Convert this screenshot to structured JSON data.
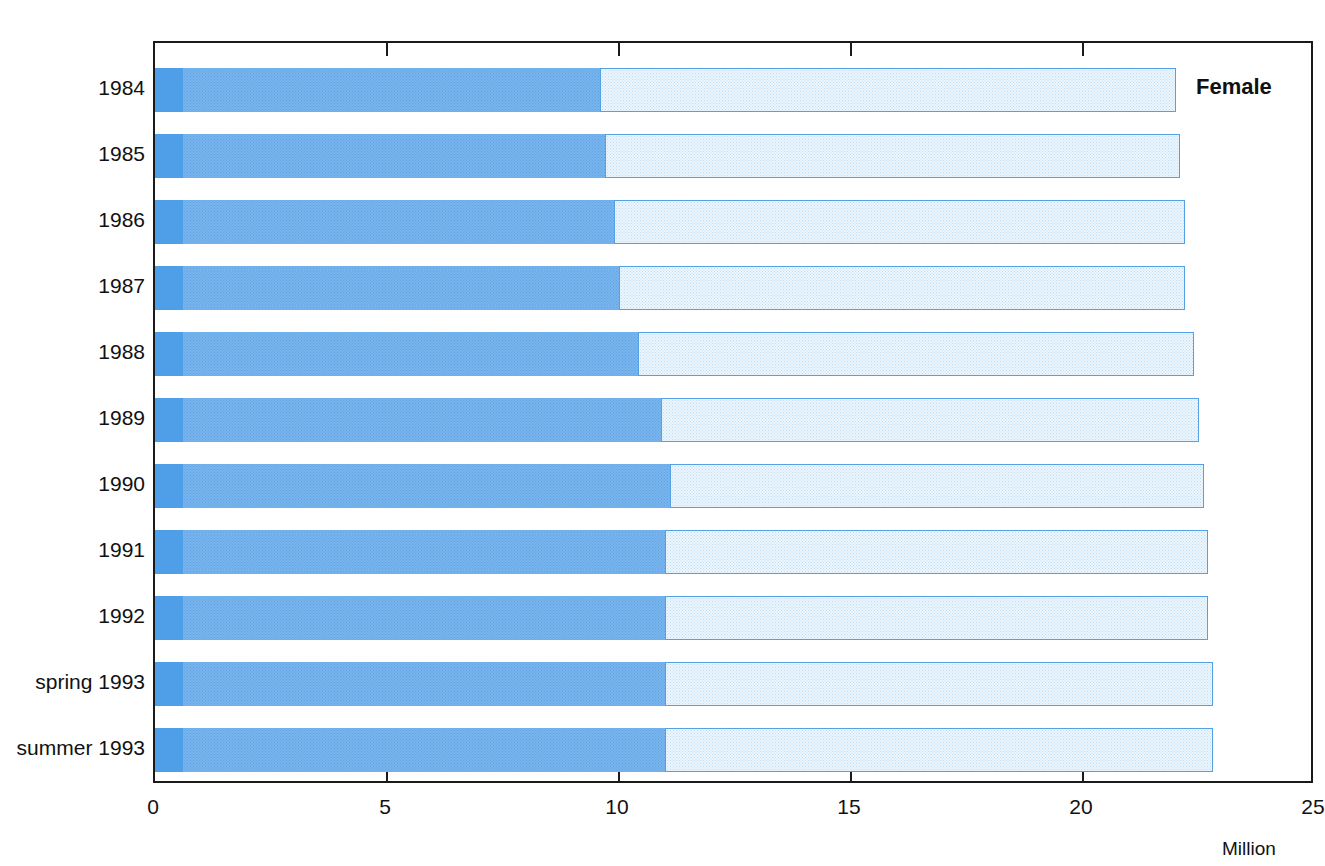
{
  "chart_data": {
    "type": "bar",
    "orientation": "horizontal",
    "stacked": true,
    "title": "",
    "subtitle": "",
    "annotation": "Female",
    "xlabel": "Million",
    "ylabel": "",
    "xlim": [
      0,
      25
    ],
    "xticks": [
      0,
      5,
      10,
      15,
      20,
      25
    ],
    "xtick_labels": [
      "0",
      "5",
      "10",
      "15",
      "20",
      "25"
    ],
    "grid": false,
    "legend": false,
    "categories": [
      "1984",
      "1985",
      "1986",
      "1987",
      "1988",
      "1989",
      "1990",
      "1991",
      "1992",
      "spring 1993",
      "summer 1993"
    ],
    "series": [
      {
        "name": "segment-1",
        "color": "#4f9fe8",
        "values": [
          0.6,
          0.6,
          0.6,
          0.6,
          0.6,
          0.6,
          0.6,
          0.6,
          0.6,
          0.6,
          0.6
        ]
      },
      {
        "name": "segment-2",
        "color": "#79b4ec",
        "values": [
          9.0,
          9.1,
          9.3,
          9.4,
          9.8,
          10.3,
          10.5,
          10.4,
          10.4,
          10.4,
          10.4
        ]
      },
      {
        "name": "segment-3",
        "color": "#eef6fd",
        "values": [
          12.4,
          12.4,
          12.3,
          12.2,
          12.0,
          11.6,
          11.5,
          11.7,
          11.7,
          11.8,
          11.8
        ]
      }
    ],
    "cumulative_boundaries": [
      [
        0.6,
        9.6,
        22.0
      ],
      [
        0.6,
        9.7,
        22.1
      ],
      [
        0.6,
        9.9,
        22.2
      ],
      [
        0.6,
        10.0,
        22.2
      ],
      [
        0.6,
        10.4,
        22.4
      ],
      [
        0.6,
        10.9,
        22.5
      ],
      [
        0.6,
        11.1,
        22.6
      ],
      [
        0.6,
        11.0,
        22.7
      ],
      [
        0.6,
        11.0,
        22.7
      ],
      [
        0.6,
        11.0,
        22.8
      ],
      [
        0.6,
        11.0,
        22.9
      ]
    ],
    "totals": [
      22.0,
      22.1,
      22.2,
      22.2,
      22.4,
      22.5,
      22.6,
      22.7,
      22.7,
      22.8,
      22.9
    ]
  },
  "axis": {
    "unit_label": "Million"
  }
}
